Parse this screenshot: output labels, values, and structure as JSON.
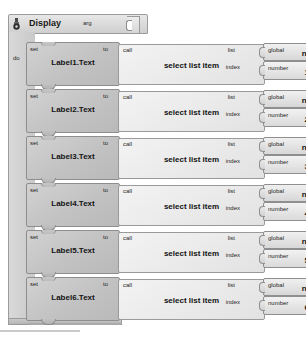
{
  "app": {
    "title": "Blocks Editor",
    "canvas_background": "#ffffff",
    "block_fill_statement": "#c2c2c2",
    "block_fill_value": "#e9e9e9",
    "block_border": "#8e8e8e"
  },
  "procedure": {
    "icon": "mutator-gear-icon",
    "keyword_to": "to",
    "name": "Display",
    "arg_label": "arg",
    "do_label": "do"
  },
  "rows": [
    {
      "set": {
        "keyword": "set",
        "target": "Label1.Text",
        "to_label": "to"
      },
      "call": {
        "keyword": "call",
        "name": "select list item",
        "list_label": "list",
        "index_label": "index"
      },
      "list_value": {
        "keyword": "global",
        "name": "nums"
      },
      "index_value": {
        "keyword": "number",
        "value": "1"
      }
    },
    {
      "set": {
        "keyword": "set",
        "target": "Label2.Text",
        "to_label": "to"
      },
      "call": {
        "keyword": "call",
        "name": "select list item",
        "list_label": "list",
        "index_label": "index"
      },
      "list_value": {
        "keyword": "global",
        "name": "nums"
      },
      "index_value": {
        "keyword": "number",
        "value": "2"
      }
    },
    {
      "set": {
        "keyword": "set",
        "target": "Label3.Text",
        "to_label": "to"
      },
      "call": {
        "keyword": "call",
        "name": "select list item",
        "list_label": "list",
        "index_label": "index"
      },
      "list_value": {
        "keyword": "global",
        "name": "nums"
      },
      "index_value": {
        "keyword": "number",
        "value": "3"
      }
    },
    {
      "set": {
        "keyword": "set",
        "target": "Label4.Text",
        "to_label": "to"
      },
      "call": {
        "keyword": "call",
        "name": "select list item",
        "list_label": "list",
        "index_label": "index"
      },
      "list_value": {
        "keyword": "global",
        "name": "nums"
      },
      "index_value": {
        "keyword": "number",
        "value": "4"
      }
    },
    {
      "set": {
        "keyword": "set",
        "target": "Label5.Text",
        "to_label": "to"
      },
      "call": {
        "keyword": "call",
        "name": "select list item",
        "list_label": "list",
        "index_label": "index"
      },
      "list_value": {
        "keyword": "global",
        "name": "nums"
      },
      "index_value": {
        "keyword": "number",
        "value": "5"
      }
    },
    {
      "set": {
        "keyword": "set",
        "target": "Label6.Text",
        "to_label": "to"
      },
      "call": {
        "keyword": "call",
        "name": "select list item",
        "list_label": "list",
        "index_label": "index"
      },
      "list_value": {
        "keyword": "global",
        "name": "nums"
      },
      "index_value": {
        "keyword": "number",
        "value": "6"
      }
    }
  ]
}
